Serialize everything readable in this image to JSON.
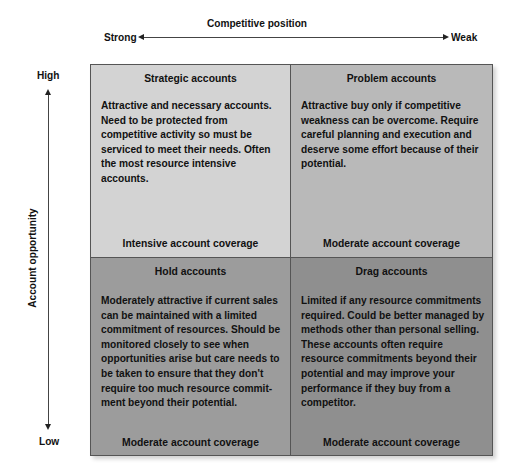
{
  "x_axis": {
    "title": "Competitive position",
    "left_label": "Strong",
    "right_label": "Weak"
  },
  "y_axis": {
    "title": "Account opportunity",
    "top_label": "High",
    "bottom_label": "Low"
  },
  "quadrants": [
    {
      "position": "top-left",
      "title": "Strategic accounts",
      "description": "Attractive and necessary accounts. Need to be protected from competitive activity so must be serviced to meet their needs. Often the most resource intensive accounts.",
      "coverage": "Intensive account coverage",
      "color": "#d3d3d3"
    },
    {
      "position": "top-right",
      "title": "Problem accounts",
      "description": "Attractive buy only if competitive weakness can be overcome. Require careful planning and execution and deserve some effort because of their potential.",
      "coverage": "Moderate account coverage",
      "color": "#b9b9b9"
    },
    {
      "position": "bottom-left",
      "title": "Hold accounts",
      "description": "Moderately attractive if current sales can be maintained with a limited commitment of resources. Should be monitored closely to see when opportunities arise but care needs to be taken to ensure that they don't require too much resource commit-ment beyond their potential.",
      "coverage": "Moderate account coverage",
      "color": "#9c9c9c"
    },
    {
      "position": "bottom-right",
      "title": "Drag accounts",
      "description": "Limited if any resource commitments required. Could be better managed by methods other than personal selling. These accounts often require resource commitments beyond their potential and may improve your performance if they buy from a competitor.",
      "coverage": "Moderate account coverage",
      "color": "#8f8f8f"
    }
  ]
}
